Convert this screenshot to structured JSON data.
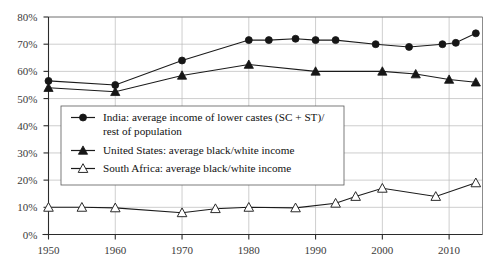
{
  "chart_data": {
    "type": "line",
    "title": "",
    "subtitle": "",
    "xlabel": "",
    "ylabel": "",
    "xlim": [
      1950,
      2015
    ],
    "ylim": [
      0,
      80
    ],
    "grid": true,
    "legend_position": "center-left",
    "x_ticks": [
      1950,
      1960,
      1970,
      1980,
      1990,
      2000,
      2010
    ],
    "x_tick_labels": [
      "1950",
      "1960",
      "1970",
      "1980",
      "1990",
      "2000",
      "2010"
    ],
    "y_ticks": [
      0,
      10,
      20,
      30,
      40,
      50,
      60,
      70,
      80
    ],
    "y_tick_labels": [
      "0%",
      "10%",
      "20%",
      "30%",
      "40%",
      "50%",
      "60%",
      "70%",
      "80%"
    ],
    "series": [
      {
        "name": "India: average income of lower castes (SC + ST)/ rest of population",
        "marker": "filled-circle",
        "color": "#161616",
        "x": [
          1950,
          1960,
          1970,
          1980,
          1983,
          1987,
          1990,
          1993,
          1999,
          2004,
          2009,
          2011,
          2014
        ],
        "values": [
          56.5,
          55,
          64,
          71.5,
          71.5,
          72,
          71.5,
          71.5,
          70,
          69,
          70,
          70.5,
          74
        ]
      },
      {
        "name": "United States: average black/white income",
        "marker": "filled-triangle",
        "color": "#161616",
        "x": [
          1950,
          1960,
          1970,
          1980,
          1990,
          2000,
          2005,
          2010,
          2014
        ],
        "values": [
          54,
          52.5,
          58.5,
          62.5,
          60,
          60,
          59,
          57,
          56
        ]
      },
      {
        "name": "South Africa: average black/white income",
        "marker": "open-triangle",
        "color": "#2a2a2a",
        "x": [
          1950,
          1955,
          1960,
          1970,
          1975,
          1980,
          1987,
          1993,
          1996,
          2000,
          2008,
          2014
        ],
        "values": [
          10,
          10,
          9.8,
          8,
          9.5,
          10,
          9.8,
          11.5,
          14,
          17,
          14,
          19
        ]
      }
    ],
    "legend_entries": [
      "India: average income of lower castes (SC + ST)/",
      "rest of population",
      "United States: average black/white income",
      "South Africa: average black/white income"
    ]
  }
}
